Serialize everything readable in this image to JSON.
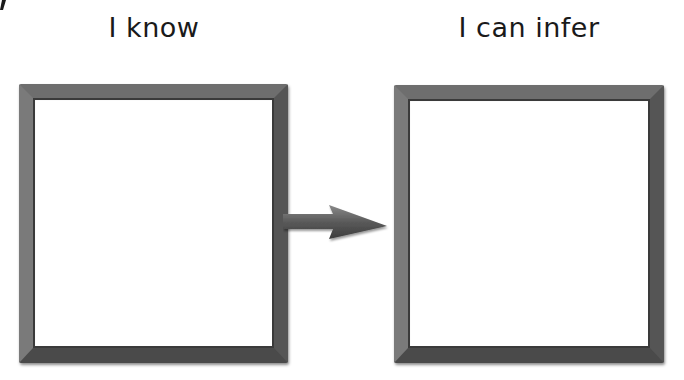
{
  "diagram": {
    "left_panel": {
      "label": "I know",
      "content": ""
    },
    "right_panel": {
      "label": "I can infer",
      "content": ""
    },
    "connector": {
      "type": "arrow",
      "direction": "right",
      "from": "I know",
      "to": "I can infer"
    },
    "colors": {
      "frame": "#5f5f5f",
      "background": "#ffffff",
      "text": "#1a1a1a"
    }
  }
}
